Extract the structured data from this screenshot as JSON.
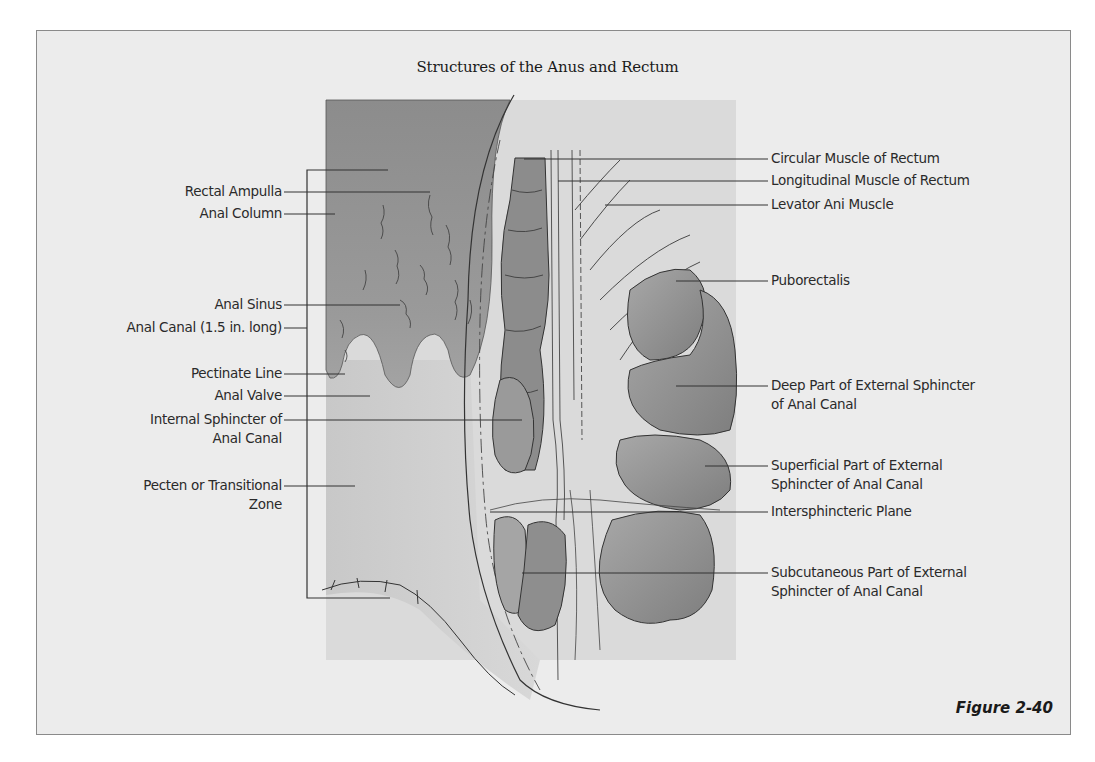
{
  "figure": {
    "title": "Structures of the Anus and Rectum",
    "caption": "Figure 2-40"
  },
  "labels_left": [
    {
      "id": "rectal-ampulla",
      "lines": [
        "Rectal Ampulla"
      ]
    },
    {
      "id": "anal-column",
      "lines": [
        "Anal Column"
      ]
    },
    {
      "id": "anal-sinus",
      "lines": [
        "Anal Sinus"
      ]
    },
    {
      "id": "anal-canal",
      "lines": [
        "Anal Canal (1.5 in. long)"
      ]
    },
    {
      "id": "pectinate-line",
      "lines": [
        "Pectinate Line"
      ]
    },
    {
      "id": "anal-valve",
      "lines": [
        "Anal Valve"
      ]
    },
    {
      "id": "internal-sphincter",
      "lines": [
        "Internal Sphincter of",
        "Anal Canal"
      ]
    },
    {
      "id": "pecten",
      "lines": [
        "Pecten or Transitional",
        "Zone"
      ]
    }
  ],
  "labels_right": [
    {
      "id": "circular-muscle",
      "lines": [
        "Circular Muscle of Rectum"
      ]
    },
    {
      "id": "longitudinal-muscle",
      "lines": [
        "Longitudinal Muscle of Rectum"
      ]
    },
    {
      "id": "levator-ani",
      "lines": [
        "Levator Ani Muscle"
      ]
    },
    {
      "id": "puborectalis",
      "lines": [
        "Puborectalis"
      ]
    },
    {
      "id": "deep-external-sphincter",
      "lines": [
        "Deep Part of External Sphincter",
        "of Anal Canal"
      ]
    },
    {
      "id": "superficial-external-sphincter",
      "lines": [
        "Superficial Part of External",
        "Sphincter of Anal Canal"
      ]
    },
    {
      "id": "intersphincteric-plane",
      "lines": [
        "Intersphincteric Plane"
      ]
    },
    {
      "id": "subcutaneous-external-sphincter",
      "lines": [
        "Subcutaneous Part of External",
        "Sphincter of Anal Canal"
      ]
    }
  ],
  "colors": {
    "background": "#ececec",
    "mucosa_dark": "#8f8f8f",
    "muscle": "#9a9a9a",
    "muscle_dark": "#7d7d7d",
    "line": "#333333"
  }
}
